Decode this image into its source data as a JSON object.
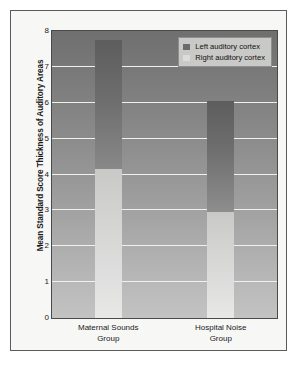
{
  "chart_data": {
    "type": "bar",
    "title": "",
    "subtitle": "",
    "xlabel": "",
    "ylabel": "Mean Standard Score Thickness of Auditory Areas",
    "ylim": [
      0,
      8
    ],
    "yticks": [
      8,
      7,
      6,
      5,
      4,
      3,
      2,
      1,
      0
    ],
    "grid": true,
    "legend_position": "top-right",
    "categories": [
      "Maternal Sounds Group",
      "Hospital Noise Group"
    ],
    "category_lines": [
      [
        "Maternal Sounds",
        "Group"
      ],
      [
        "Hospital Noise",
        "Group"
      ]
    ],
    "series": [
      {
        "name": "Left auditory cortex",
        "color": "#6b6b6b",
        "values": [
          7.75,
          6.05
        ]
      },
      {
        "name": "Right auditory cortex",
        "color": "#dcdcda",
        "values": [
          4.15,
          2.95
        ]
      }
    ]
  },
  "legend": {
    "items": [
      {
        "label": "Left auditory cortex",
        "swatch": "left"
      },
      {
        "label": "Right auditory cortex",
        "swatch": "right"
      }
    ]
  },
  "caption": {
    "text": ""
  },
  "colors": {
    "frame_border": "#5b5b5b",
    "plot_border": "#4a4a4a",
    "gridline": "#f0f0ee",
    "page_background": "#ffffff",
    "figure_background": "#f7f7f6"
  }
}
